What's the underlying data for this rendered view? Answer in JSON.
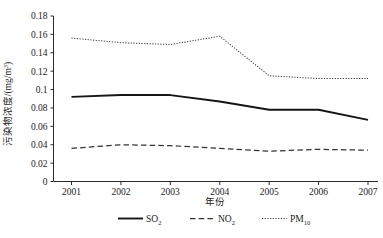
{
  "chart_data": {
    "type": "line",
    "title": "",
    "xlabel": "年份",
    "ylabel": "污染物浓度/(mg/m³)",
    "ylabel_parts": {
      "main": "污染物浓度/(mg/m",
      "exponent": "3",
      "tail": ")"
    },
    "categories": [
      "2001",
      "2002",
      "2003",
      "2004",
      "2005",
      "2006",
      "2007"
    ],
    "x": [
      2001,
      2002,
      2003,
      2004,
      2005,
      2006,
      2007
    ],
    "xlim": [
      2001,
      2007
    ],
    "ylim": [
      0,
      0.18
    ],
    "yticks": [
      "0",
      "0.02",
      "0.04",
      "0.06",
      "0.08",
      "0.1",
      "0.12",
      "0.14",
      "0.16",
      "0.18"
    ],
    "ytick_values": [
      0,
      0.02,
      0.04,
      0.06,
      0.08,
      0.1,
      0.12,
      0.14,
      0.16,
      0.18
    ],
    "grid": false,
    "legend_position": "bottom",
    "series": [
      {
        "name": "SO2",
        "label_base": "SO",
        "label_sub": "2",
        "style": "solid",
        "color": "#151515",
        "values": [
          0.092,
          0.094,
          0.094,
          0.087,
          0.078,
          0.078,
          0.067
        ]
      },
      {
        "name": "NO2",
        "label_base": "NO",
        "label_sub": "2",
        "style": "dashed",
        "color": "#333333",
        "values": [
          0.036,
          0.04,
          0.039,
          0.036,
          0.033,
          0.035,
          0.034
        ]
      },
      {
        "name": "PM10",
        "label_base": "PM",
        "label_sub": "10",
        "style": "dotted",
        "color": "#3a3a3a",
        "values": [
          0.156,
          0.151,
          0.149,
          0.158,
          0.115,
          0.112,
          0.112
        ]
      }
    ]
  }
}
